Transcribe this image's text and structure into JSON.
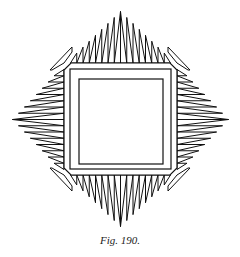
{
  "figure": {
    "caption": "Fig. 190.",
    "stroke_color": "#111111",
    "background": "#ffffff"
  }
}
